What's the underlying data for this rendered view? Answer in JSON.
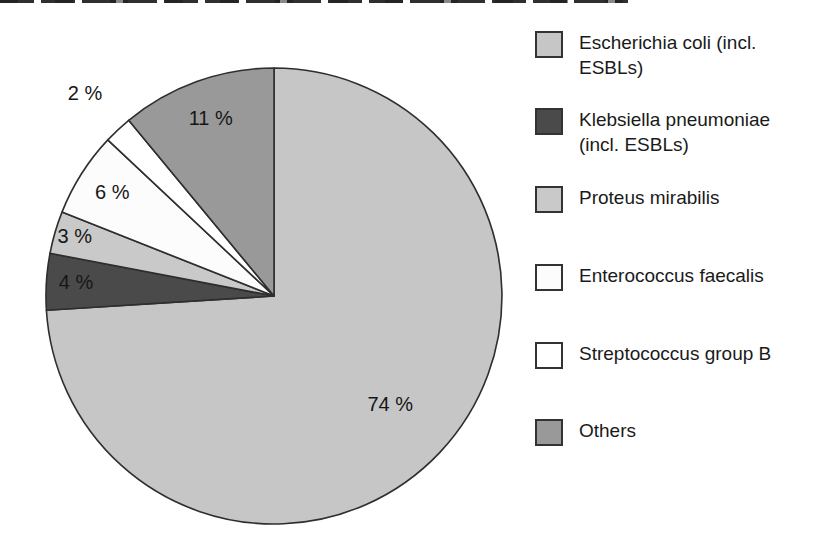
{
  "figure": {
    "background_color": "#ffffff",
    "stroke_color": "#2e2e2e"
  },
  "chart_data": {
    "type": "pie",
    "title": "",
    "legend_position": "right",
    "start_angle_deg": 0,
    "direction": "clockwise",
    "categories": [
      "Escherichia coli (incl. ESBLs)",
      "Klebsiella pneumoniae (incl. ESBLs)",
      "Proteus mirabilis",
      "Enterococcus faecalis",
      "Streptococcus group B",
      "Others"
    ],
    "values": [
      74,
      4,
      3,
      6,
      2,
      11
    ],
    "slices": [
      {
        "label": "Escherichia coli (incl. ESBLs)",
        "value": 74,
        "display": "74 %",
        "color": "#c6c6c6",
        "label_r": 0.7,
        "label_outside": false
      },
      {
        "label": "Klebsiella pneumoniae (incl. ESBLs)",
        "value": 4,
        "display": "4 %",
        "color": "#4a4a4a",
        "label_r": 0.87,
        "label_outside": false
      },
      {
        "label": "Proteus mirabilis",
        "value": 3,
        "display": "3 %",
        "color": "#c9c9c9",
        "label_r": 0.91,
        "label_outside": false
      },
      {
        "label": "Enterococcus faecalis",
        "value": 6,
        "display": "6 %",
        "color": "#fcfcfc",
        "label_r": 0.84,
        "label_outside": false
      },
      {
        "label": "Streptococcus group B",
        "value": 2,
        "display": "2 %",
        "color": "#ffffff",
        "label_r": 1.21,
        "label_outside": true
      },
      {
        "label": "Others",
        "value": 11,
        "display": "11 %",
        "color": "#999999",
        "label_r": 0.82,
        "label_outside": false
      }
    ]
  }
}
